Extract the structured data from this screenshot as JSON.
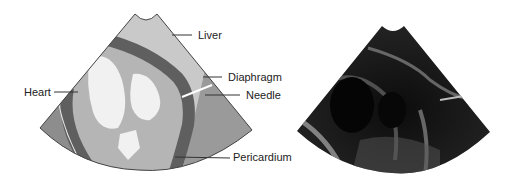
{
  "figure": {
    "labels": {
      "liver": "Liver",
      "diaphragm": "Diaphragm",
      "needle": "Needle",
      "heart": "Heart",
      "pericardium": "Pericardium"
    },
    "colors": {
      "liver": "#c9c9c9",
      "diaphragm_region": "#9a9a9a",
      "band": "#5f5f5f",
      "heart_bg": "#b5b5b5",
      "chamber": "#f1f1f1",
      "outer_left": "#8d8d8d",
      "ultrasound_bg": "#1a1a1a"
    }
  }
}
